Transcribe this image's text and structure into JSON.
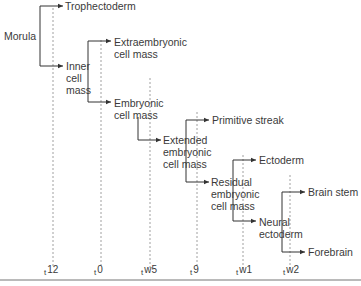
{
  "diagram": {
    "nodes": {
      "morula": "Morula",
      "trophectoderm": "Trophectoderm",
      "inner_cell_mass": "Inner\ncell\nmass",
      "extraembryonic": "Extraembryonic\ncell mass",
      "embryonic": "Embryonic\ncell mass",
      "primitive_streak": "Primitive streak",
      "extended": "Extended\nembryonic\ncell mass",
      "ectoderm": "Ectoderm",
      "residual": "Residual\nembryonic\ncell mass",
      "brain_stem": "Brain stem",
      "neural_ectoderm": "Neural\nectoderm",
      "forebrain": "Forebrain"
    },
    "timepoints": [
      {
        "sub": "t",
        "label": "12"
      },
      {
        "sub": "t",
        "label": "0"
      },
      {
        "sub": "t",
        "label": "w5"
      },
      {
        "sub": "t",
        "label": "9"
      },
      {
        "sub": "t",
        "label": "w1"
      },
      {
        "sub": "t",
        "label": "w2"
      }
    ]
  }
}
